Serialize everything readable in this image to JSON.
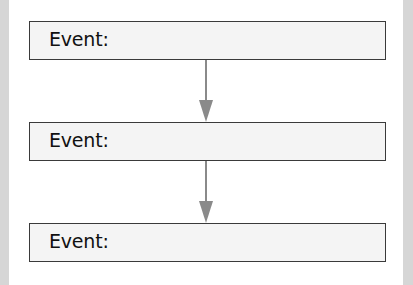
{
  "diagram": {
    "type": "flowchart",
    "events": [
      {
        "label": "Event:"
      },
      {
        "label": "Event:"
      },
      {
        "label": "Event:"
      }
    ],
    "colors": {
      "box_fill": "#f4f4f4",
      "box_border": "#3a3a3a",
      "arrow": "#8a8a8a",
      "side_bar": "#d6d6d6"
    }
  }
}
